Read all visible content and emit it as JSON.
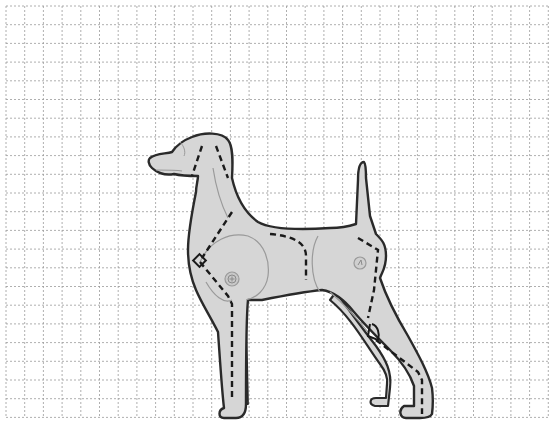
{
  "grid": {
    "origin_x": 6,
    "origin_y": 6,
    "spacing": 18.7,
    "columns": 29,
    "rows": 22,
    "line_color": "#9a9a9a",
    "dash": "2,2"
  },
  "figure": {
    "fill_color": "#d6d6d6",
    "outline_color": "#2a2a2a",
    "seam_color": "#9a9a9a",
    "dashed_cut_color": "#1a1a1a",
    "markers": [
      {
        "type": "button-joint",
        "name": "front-shoulder-joint",
        "x": 232,
        "y": 279
      },
      {
        "type": "button-joint",
        "name": "hip-joint",
        "x": 360,
        "y": 263
      },
      {
        "type": "diamond",
        "name": "chest-notch",
        "x": 200,
        "y": 261
      },
      {
        "type": "angle",
        "name": "hock-notch",
        "x": 372,
        "y": 328
      }
    ]
  }
}
